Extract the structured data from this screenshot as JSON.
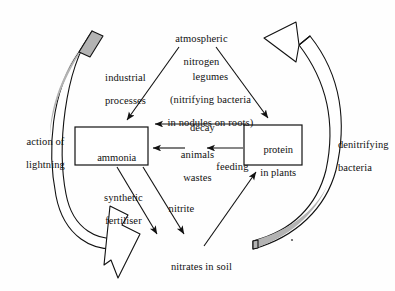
{
  "diagram": {
    "title": "atmospheric nitrogen",
    "type": "nitrogen-cycle",
    "background_color": "#fefefe",
    "stroke_color": "#111111",
    "band_fill_color": "#b3b3b3",
    "nodes": {
      "atmospheric_nitrogen": {
        "label_line1": "atmospheric",
        "label_line2": "nitrogen"
      },
      "ammonia": {
        "label": "ammonia"
      },
      "protein_in_plants": {
        "label_line1": "protein",
        "label_line2": "in plants"
      },
      "nitrates_in_soil": {
        "label": "nitrates in soil"
      }
    },
    "process_labels": {
      "industrial": {
        "line1": "industrial",
        "line2": "processes"
      },
      "legumes": {
        "line1": "legumes",
        "line2": "(nitrifying bacteria",
        "line3": "in nodules on roots)"
      },
      "decay": {
        "text": "decay"
      },
      "animals_wastes": {
        "line1": "animals",
        "line2": "wastes"
      },
      "feeding": {
        "text": "feeding"
      },
      "synthetic_fertiliser": {
        "line1": "synthetic",
        "line2": "fertiliser"
      },
      "nitrite": {
        "text": "nitrite"
      },
      "action_of_lightning": {
        "line1": "action of",
        "line2": "lightning"
      },
      "denitrifying_bacteria": {
        "line1": "denitrifying",
        "line2": "bacteria"
      }
    }
  }
}
